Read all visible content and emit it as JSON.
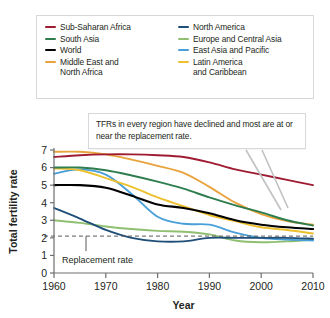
{
  "chart_data": {
    "type": "line",
    "title": "",
    "xlabel": "Year",
    "ylabel": "Total fertility rate",
    "xlim": [
      1960,
      2010
    ],
    "ylim": [
      0,
      7
    ],
    "xticks": [
      1960,
      1970,
      1980,
      1990,
      2000,
      2010
    ],
    "yticks": [
      0,
      1,
      2,
      3,
      4,
      5,
      6,
      7
    ],
    "grid": false,
    "legend_position": "top",
    "x": [
      1960,
      1965,
      1970,
      1975,
      1980,
      1985,
      1990,
      1995,
      2000,
      2005,
      2010
    ],
    "series": [
      {
        "name": "Sub-Saharan Africa",
        "color": "#9e1b32",
        "values": [
          6.6,
          6.7,
          6.75,
          6.75,
          6.7,
          6.6,
          6.3,
          5.9,
          5.6,
          5.3,
          5.0
        ]
      },
      {
        "name": "South Asia",
        "color": "#2f7d4f",
        "values": [
          6.0,
          6.0,
          5.85,
          5.55,
          5.2,
          4.8,
          4.3,
          3.85,
          3.45,
          3.0,
          2.7
        ]
      },
      {
        "name": "World",
        "color": "#000000",
        "values": [
          5.0,
          5.0,
          4.85,
          4.4,
          3.9,
          3.7,
          3.4,
          3.0,
          2.75,
          2.6,
          2.5
        ]
      },
      {
        "name": "Middle East and North Africa",
        "color": "#e8a33d",
        "values": [
          6.9,
          6.9,
          6.75,
          6.45,
          6.1,
          5.7,
          4.9,
          4.0,
          3.35,
          2.95,
          2.75
        ]
      },
      {
        "name": "North America",
        "color": "#1f4e79",
        "values": [
          3.7,
          3.1,
          2.45,
          2.0,
          1.8,
          1.8,
          2.0,
          2.0,
          2.0,
          2.0,
          1.95
        ]
      },
      {
        "name": "Europe and Central Asia",
        "color": "#8fbf6f",
        "values": [
          3.0,
          2.85,
          2.65,
          2.5,
          2.4,
          2.35,
          2.2,
          1.85,
          1.75,
          1.8,
          1.9
        ]
      },
      {
        "name": "East Asia and Pacific",
        "color": "#4a9fd8",
        "values": [
          5.65,
          5.9,
          5.6,
          4.5,
          3.2,
          2.8,
          2.75,
          2.3,
          2.0,
          1.9,
          1.85
        ]
      },
      {
        "name": "Latin America and Caribbean",
        "color": "#edc02e",
        "values": [
          5.95,
          5.85,
          5.4,
          4.9,
          4.3,
          3.8,
          3.3,
          2.95,
          2.6,
          2.45,
          2.25
        ]
      }
    ],
    "reference_line": {
      "label": "Replacement rate",
      "value": 2.1,
      "style": "dashed"
    },
    "annotation": "TFRs in every region have declined and most are at or near the replacement rate."
  },
  "legend": {
    "items": [
      {
        "label": "Sub-Saharan Africa",
        "color": "#9e1b32"
      },
      {
        "label": "North America",
        "color": "#1f4e79"
      },
      {
        "label": "South Asia",
        "color": "#2f7d4f"
      },
      {
        "label": "Europe and Central Asia",
        "color": "#8fbf6f"
      },
      {
        "label": "World",
        "color": "#000000"
      },
      {
        "label": "East Asia and Pacific",
        "color": "#4a9fd8"
      },
      {
        "label": "Middle East and\nNorth Africa",
        "color": "#e8a33d"
      },
      {
        "label": "Latin America\nand Caribbean",
        "color": "#edc02e"
      }
    ]
  },
  "axes": {
    "x_title": "Year",
    "y_title": "Total fertility rate",
    "x_tick_labels": [
      "1960",
      "1970",
      "1980",
      "1990",
      "2000",
      "2010"
    ],
    "y_tick_labels": [
      "0",
      "1",
      "2",
      "3",
      "4",
      "5",
      "6",
      "7"
    ]
  },
  "callout": {
    "text": "TFRs in every region have declined and most are at or near the replacement rate."
  },
  "reference": {
    "label": "Replacement rate"
  }
}
